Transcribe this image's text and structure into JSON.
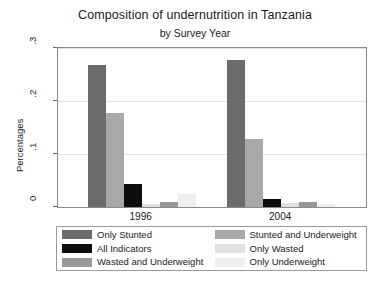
{
  "chart_data": {
    "type": "bar",
    "title": "Composition of undernutrition in Tanzania",
    "subtitle": "by Survey Year",
    "xlabel": "",
    "ylabel": "Percentages",
    "categories": [
      "1996",
      "2004"
    ],
    "ylim": [
      0,
      0.3
    ],
    "yticks": [
      "0",
      ".1",
      ".2",
      ".3"
    ],
    "ytick_values": [
      0,
      0.1,
      0.2,
      0.3
    ],
    "grid": true,
    "legend_position": "bottom",
    "grouped": true,
    "series": [
      {
        "name": "Only Stunted",
        "color": "#6b6b6b",
        "values": [
          0.268,
          0.277
        ]
      },
      {
        "name": "Stunted and Underweight",
        "color": "#a8a8a8",
        "values": [
          0.177,
          0.128
        ]
      },
      {
        "name": "All Indicators",
        "color": "#0d0d0d",
        "values": [
          0.043,
          0.016
        ]
      },
      {
        "name": "Only Wasted",
        "color": "#e0e0e0",
        "values": [
          0.006,
          0.008
        ]
      },
      {
        "name": "Wasted and Underweight",
        "color": "#989898",
        "values": [
          0.01,
          0.01
        ]
      },
      {
        "name": "Only Underweight",
        "color": "#efefef",
        "values": [
          0.024,
          0.005
        ]
      }
    ]
  },
  "legend": {
    "items": [
      {
        "label": "Only Stunted",
        "color": "#6b6b6b"
      },
      {
        "label": "Stunted and Underweight",
        "color": "#a8a8a8"
      },
      {
        "label": "All Indicators",
        "color": "#0d0d0d"
      },
      {
        "label": "Only Wasted",
        "color": "#e0e0e0"
      },
      {
        "label": "Wasted and Underweight",
        "color": "#989898"
      },
      {
        "label": "Only Underweight",
        "color": "#efefef"
      }
    ]
  }
}
